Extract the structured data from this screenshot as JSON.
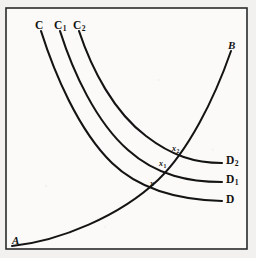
{
  "figure": {
    "background_color": "#f2f1ef",
    "plot_background_color": "#fbfaf8",
    "line_color": "#141414",
    "frame_color": "#2b2b2b",
    "frame": {
      "x": 6,
      "y": 8,
      "width": 241,
      "height": 241
    }
  },
  "labels": {
    "curve_c": "C",
    "curve_c1_base": "C",
    "curve_c1_sub": "1",
    "curve_c2_base": "C",
    "curve_c2_sub": "2",
    "curve_d": "D",
    "curve_d1_base": "D",
    "curve_d1_sub": "1",
    "curve_d2_base": "D",
    "curve_d2_sub": "2",
    "endpoint_a": "A",
    "endpoint_b": "B",
    "point_x": "x",
    "point_x1_base": "x",
    "point_x1_sub": "1",
    "point_x2_base": "x",
    "point_x2_sub": "2"
  },
  "chart_data": {
    "type": "line",
    "title": "",
    "xlabel": "",
    "ylabel": "",
    "grid": false,
    "legend_position": "none",
    "axis_ranges": {
      "x": [
        6,
        247
      ],
      "y": [
        8,
        249
      ]
    },
    "series": [
      {
        "name": "AB",
        "role": "upward-sloping curve",
        "start_label": "A",
        "end_label": "B",
        "path": "M 12 246 C 60 241, 120 216, 158 180 C 188 151, 214 100, 231 51",
        "points": [
          {
            "x": 12,
            "y": 246
          },
          {
            "x": 60,
            "y": 241
          },
          {
            "x": 120,
            "y": 216
          },
          {
            "x": 158,
            "y": 180
          },
          {
            "x": 188,
            "y": 151
          },
          {
            "x": 214,
            "y": 100
          },
          {
            "x": 231,
            "y": 51
          }
        ]
      },
      {
        "name": "CD",
        "role": "downward-sloping curve",
        "start_label": "C",
        "end_label": "D",
        "path": "M 41 31 C 54 72, 78 130, 112 163 C 141 191, 183 200, 222 201",
        "points": [
          {
            "x": 41,
            "y": 31
          },
          {
            "x": 78,
            "y": 130
          },
          {
            "x": 112,
            "y": 163
          },
          {
            "x": 222,
            "y": 201
          }
        ]
      },
      {
        "name": "C1D1",
        "role": "downward-sloping curve",
        "start_label": "C1",
        "end_label": "D1",
        "path": "M 60 31 C 73 72, 96 122, 128 150 C 157 176, 190 182, 222 182",
        "points": [
          {
            "x": 60,
            "y": 31
          },
          {
            "x": 96,
            "y": 122
          },
          {
            "x": 128,
            "y": 150
          },
          {
            "x": 222,
            "y": 182
          }
        ]
      },
      {
        "name": "C2D2",
        "role": "downward-sloping curve",
        "start_label": "C2",
        "end_label": "D2",
        "path": "M 79 31 C 92 70, 114 112, 146 136 C 172 156, 195 163, 222 163",
        "points": [
          {
            "x": 79,
            "y": 31
          },
          {
            "x": 114,
            "y": 112
          },
          {
            "x": 146,
            "y": 136
          },
          {
            "x": 222,
            "y": 163
          }
        ]
      }
    ],
    "annotations": [
      {
        "label": "x",
        "x": 152,
        "y": 186,
        "description": "intersection of AB with CD"
      },
      {
        "label": "x1",
        "x": 161,
        "y": 167,
        "description": "intersection of AB with C1D1"
      },
      {
        "label": "x2",
        "x": 175,
        "y": 152,
        "description": "intersection of AB with C2D2"
      }
    ]
  }
}
